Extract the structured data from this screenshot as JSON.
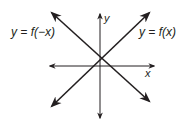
{
  "diagram": {
    "axes": {
      "x_label": "x",
      "y_label": "y"
    },
    "curves": [
      {
        "name": "f",
        "label": "y = f(x)",
        "description": "line with positive slope through near origin"
      },
      {
        "name": "f_reflected",
        "label": "y = f(−x)",
        "description": "line with negative slope, reflection of f across y-axis"
      }
    ],
    "colors": {
      "stroke": "#231f20",
      "background": "#ffffff"
    }
  }
}
